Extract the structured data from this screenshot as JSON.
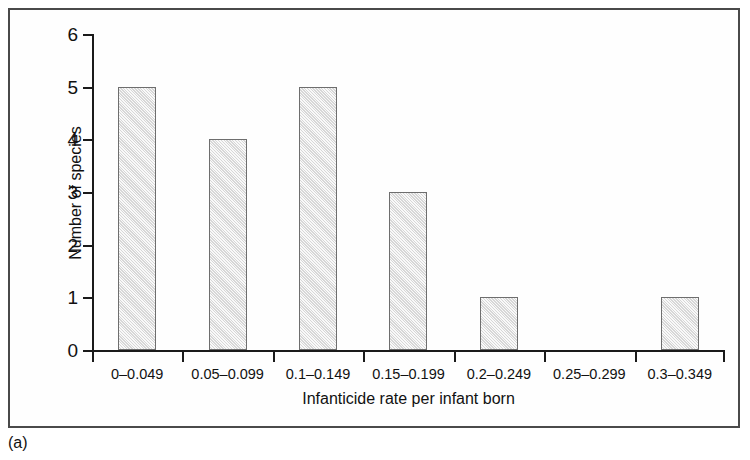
{
  "caption": "(a)",
  "chart_data": {
    "type": "bar",
    "title": "",
    "subtitle": "",
    "xlabel": "Infanticide rate per infant born",
    "ylabel": "Number of species",
    "categories": [
      "0–0.049",
      "0.05–0.099",
      "0.1–0.149",
      "0.15–0.199",
      "0.2–0.249",
      "0.25–0.299",
      "0.3–0.349"
    ],
    "values": [
      5,
      4,
      5,
      3,
      1,
      0,
      1
    ],
    "ylim": [
      0,
      6
    ],
    "yticks": [
      0,
      1,
      2,
      3,
      4,
      5,
      6
    ],
    "ytick_labels": [
      "0",
      "1",
      "2",
      "3",
      "4",
      "5",
      "6"
    ],
    "grid": false,
    "legend": null,
    "bar_fill_color": "#e9e9e9",
    "bar_border_color": "#6e6e6e",
    "axis_color": "#1a1a1a",
    "frame_color": "#4a4a4a"
  }
}
